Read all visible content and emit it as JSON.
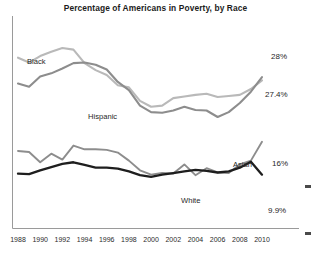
{
  "chart_data": {
    "type": "line",
    "title": "Percentage of Americans in Poverty, by Race",
    "xlabel": "",
    "ylabel": "",
    "xlim": [
      1988,
      2010
    ],
    "ylim": [
      0,
      36
    ],
    "grid": false,
    "legend": "inline-labels",
    "x": [
      1988,
      1989,
      1990,
      1991,
      1992,
      1993,
      1994,
      1995,
      1996,
      1997,
      1998,
      1999,
      2000,
      2001,
      2002,
      2003,
      2004,
      2005,
      2006,
      2007,
      2008,
      2009,
      2010
    ],
    "series": [
      {
        "name": "Black",
        "color": "#b9b9b9",
        "label_value": "27.4%",
        "values": [
          31.6,
          30.7,
          31.9,
          32.7,
          33.4,
          33.1,
          30.6,
          29.3,
          28.4,
          26.5,
          26.1,
          23.6,
          22.5,
          22.7,
          24.1,
          24.4,
          24.7,
          24.9,
          24.3,
          24.5,
          24.7,
          25.8,
          27.4
        ]
      },
      {
        "name": "Hispanic",
        "color": "#8d8d8d",
        "label_value": "28%",
        "values": [
          26.8,
          26.2,
          28.1,
          28.7,
          29.6,
          30.6,
          30.7,
          30.3,
          29.4,
          27.1,
          25.6,
          22.7,
          21.5,
          21.4,
          21.8,
          22.5,
          21.9,
          21.8,
          20.6,
          21.5,
          23.2,
          25.3,
          28.0
        ]
      },
      {
        "name": "Asian",
        "color": "#8d8d8d",
        "label_value": "16%",
        "values": [
          14.3,
          14.1,
          12.2,
          13.8,
          12.7,
          15.3,
          14.6,
          14.6,
          14.5,
          14.0,
          12.5,
          10.7,
          9.9,
          10.2,
          10.1,
          11.8,
          9.8,
          11.1,
          10.3,
          10.2,
          11.8,
          12.5,
          16.0
        ]
      },
      {
        "name": "White",
        "color": "#1e1e1e",
        "label_value": "9.9%",
        "values": [
          10.1,
          10.0,
          10.7,
          11.3,
          11.9,
          12.2,
          11.7,
          11.2,
          11.2,
          11.0,
          10.5,
          9.8,
          9.5,
          9.9,
          10.2,
          10.5,
          10.8,
          10.6,
          10.3,
          10.5,
          11.2,
          12.3,
          9.9
        ]
      }
    ],
    "tick_labels": [
      "1988",
      "1990",
      "1992",
      "1994",
      "1996",
      "1998",
      "2000",
      "2002",
      "2004",
      "2006",
      "2008",
      "2010"
    ]
  }
}
